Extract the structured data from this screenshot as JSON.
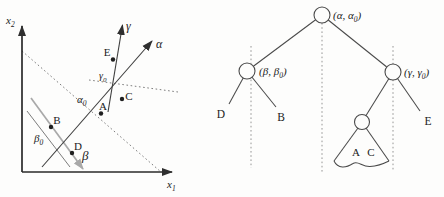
{
  "plot": {
    "y_axis": {
      "base": "x",
      "sub": "2"
    },
    "x_axis": {
      "base": "x",
      "sub": "1"
    },
    "alpha_label": "α",
    "gamma_label": "γ",
    "beta_label": "β",
    "alpha0": {
      "base": "α",
      "sub": "0"
    },
    "gamma0": {
      "base": "γ",
      "sub": "0"
    },
    "beta0": {
      "base": "β",
      "sub": "0"
    },
    "points": {
      "A": "A",
      "B": "B",
      "C": "C",
      "D": "D",
      "E": "E"
    }
  },
  "tree": {
    "root_label": {
      "pre": "(α, α",
      "sub": "0",
      "post": ")"
    },
    "left_label": {
      "pre": "(β, β",
      "sub": "0",
      "post": ")"
    },
    "right_label": {
      "pre": "(γ, γ",
      "sub": "0",
      "post": ")"
    },
    "leaf_d": "D",
    "leaf_b": "B",
    "leaf_e": "E",
    "subtree_point_a": "A",
    "subtree_point_c": "C"
  }
}
